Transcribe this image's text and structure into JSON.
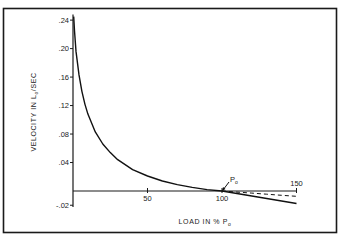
{
  "chart_data": {
    "type": "line",
    "title": "",
    "xlabel": "LOAD IN % P",
    "xlabel_subscript": "o",
    "ylabel": "VELOCITY IN L",
    "ylabel_subscript": "o",
    "ylabel_suffix": "/SEC",
    "xlim": [
      0,
      155
    ],
    "ylim": [
      -0.025,
      0.245
    ],
    "grid": false,
    "legend": null,
    "x_ticks": [
      50,
      100,
      150
    ],
    "x_tick_labels": [
      "50",
      "100",
      "150"
    ],
    "y_ticks": [
      0.24,
      0.2,
      0.16,
      0.12,
      0.08,
      0.04,
      -0.02
    ],
    "y_tick_labels": [
      ".24",
      ".20",
      ".16",
      ".12",
      ".08",
      ".04",
      "-.02"
    ],
    "annotation": {
      "text": "P",
      "subscript": "o",
      "x": 100,
      "y": 0,
      "arrow": true
    },
    "series": [
      {
        "name": "force-velocity curve (solid)",
        "style": "solid",
        "x": [
          0.5,
          1,
          2,
          4,
          6,
          8,
          10,
          15,
          20,
          25,
          30,
          40,
          50,
          60,
          70,
          80,
          90,
          100,
          110,
          120,
          130,
          140,
          150
        ],
        "y": [
          0.245,
          0.225,
          0.196,
          0.163,
          0.14,
          0.122,
          0.108,
          0.083,
          0.066,
          0.054,
          0.044,
          0.03,
          0.021,
          0.014,
          0.009,
          0.005,
          0.002,
          0.0,
          -0.0035,
          -0.007,
          -0.0105,
          -0.014,
          -0.0175
        ]
      },
      {
        "name": "extrapolation (dashed)",
        "style": "dashed",
        "x": [
          100,
          110,
          120,
          130,
          140,
          150
        ],
        "y": [
          0.0,
          -0.0015,
          -0.003,
          -0.0045,
          -0.006,
          -0.0075
        ]
      }
    ]
  }
}
